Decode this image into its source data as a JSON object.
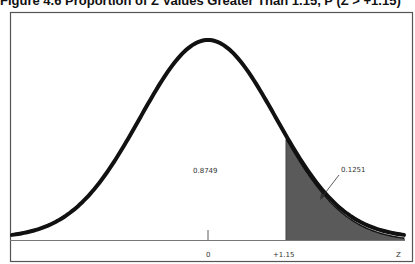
{
  "title": "Figure 4.6 Proportion of Z Values Greater Than 1.15, P (Z > +1.15)",
  "chart_data": {
    "type": "area",
    "title": "Figure 4.6 Proportion of Z Values Greater Than 1.15, P (Z > +1.15)",
    "distribution": "standard normal",
    "xlabel": "Z",
    "ylabel": "",
    "x_ticks": [
      {
        "value": 0,
        "label": "0"
      },
      {
        "value": 1.15,
        "label": "+1.15"
      }
    ],
    "x_axis_label": "Z",
    "regions": [
      {
        "name": "left of +1.15",
        "area": 0.8749,
        "label": "0.8749",
        "shaded": false
      },
      {
        "name": "right of +1.15",
        "area": 0.1251,
        "label": "0.1251",
        "shaded": true,
        "fill": "#5a5a5a"
      }
    ],
    "annotations": [
      {
        "text": "0.1251",
        "arrow": true
      },
      {
        "text": "0.8749",
        "arrow": false
      }
    ],
    "xlim": [
      -3,
      3
    ],
    "grid": false,
    "legend": "none"
  },
  "labels": {
    "left_area": "0.8749",
    "right_area": "0.1251",
    "tick_zero": "0",
    "tick_cut": "+1.15",
    "axis_z": "Z"
  },
  "colors": {
    "curve": "#111111",
    "shade": "#5a5a5a",
    "frame": "#555555"
  }
}
